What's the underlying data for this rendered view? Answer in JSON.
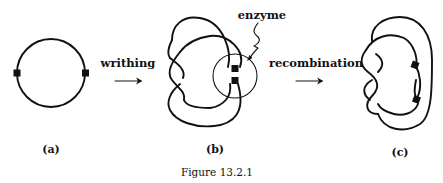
{
  "figure": {
    "caption": "Figure 13.2.1",
    "panels": [
      {
        "id": "a",
        "label": "(a)",
        "description": "Circular DNA loop with two recombination sites"
      },
      {
        "id": "b",
        "label": "(b)",
        "description": "Writhed DNA with both sites held by enzyme"
      },
      {
        "id": "c",
        "label": "(c)",
        "description": "Knotted DNA after recombination"
      }
    ],
    "arrows": [
      {
        "label": "writhing",
        "from": "a",
        "to": "b"
      },
      {
        "label": "recombination",
        "from": "b",
        "to": "c"
      }
    ],
    "annotations": {
      "enzyme": "enzyme"
    },
    "colors": {
      "ink": "#111111",
      "background": "#ffffff"
    }
  }
}
